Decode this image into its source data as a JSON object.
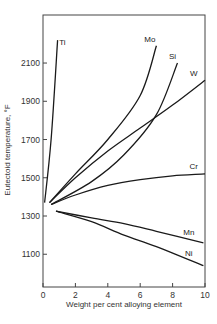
{
  "chart_data": {
    "type": "line",
    "title": "",
    "xlabel": "Weight per cent alloying element",
    "ylabel": "Eutectoid temperature, °F",
    "xlim": [
      0,
      10
    ],
    "ylim": [
      930,
      2320
    ],
    "x_ticks": [
      0,
      2,
      4,
      6,
      8,
      10
    ],
    "y_ticks": [
      1100,
      1300,
      1500,
      1700,
      1900,
      2100
    ],
    "grid": false,
    "legend": "inline labels at curve ends",
    "series": [
      {
        "name": "Ti",
        "x": [
          0.1,
          0.5,
          0.9
        ],
        "y": [
          1370,
          1700,
          2220
        ]
      },
      {
        "name": "Mo",
        "x": [
          0.4,
          2,
          4,
          6,
          7
        ],
        "y": [
          1370,
          1520,
          1700,
          1930,
          2190
        ]
      },
      {
        "name": "Si",
        "x": [
          0.5,
          3,
          5,
          7,
          8.3
        ],
        "y": [
          1360,
          1480,
          1620,
          1830,
          2100
        ]
      },
      {
        "name": "W",
        "x": [
          0.4,
          2,
          4,
          6,
          8,
          10
        ],
        "y": [
          1370,
          1500,
          1640,
          1760,
          1880,
          2010
        ]
      },
      {
        "name": "Cr",
        "x": [
          0.5,
          2,
          4,
          6,
          8,
          10
        ],
        "y": [
          1360,
          1410,
          1460,
          1490,
          1510,
          1520
        ]
      },
      {
        "name": "Mn",
        "x": [
          0.8,
          3,
          5,
          7,
          9.9
        ],
        "y": [
          1325,
          1290,
          1260,
          1220,
          1160
        ]
      },
      {
        "name": "Ni",
        "x": [
          0.8,
          3,
          5,
          7,
          9.9
        ],
        "y": [
          1325,
          1270,
          1200,
          1140,
          1040
        ]
      }
    ],
    "labels": {
      "Ti": {
        "x": 1.2,
        "y": 2195
      },
      "Mo": {
        "x": 6.6,
        "y": 2210
      },
      "Si": {
        "x": 8.0,
        "y": 2120
      },
      "W": {
        "x": 9.3,
        "y": 2030
      },
      "Cr": {
        "x": 9.3,
        "y": 1545
      },
      "Mn": {
        "x": 9.0,
        "y": 1200
      },
      "Ni": {
        "x": 9.0,
        "y": 1090
      }
    }
  }
}
